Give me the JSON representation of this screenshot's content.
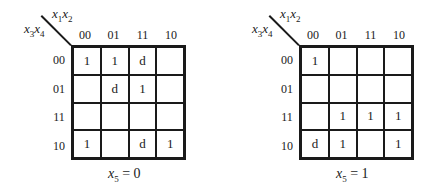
{
  "maps": [
    {
      "caption_var": "x",
      "caption_sub": "5",
      "caption_rest": " = 0",
      "col_var_label": [
        "x",
        "1",
        "x",
        "2"
      ],
      "row_var_label": [
        "x",
        "3",
        "x",
        "4"
      ],
      "col_headers": [
        "00",
        "01",
        "11",
        "10"
      ],
      "row_headers": [
        "00",
        "01",
        "11",
        "10"
      ],
      "cells": [
        [
          "1",
          "1",
          "d",
          ""
        ],
        [
          "",
          "d",
          "1",
          ""
        ],
        [
          "",
          "",
          "",
          ""
        ],
        [
          "1",
          "",
          "d",
          "1"
        ]
      ]
    },
    {
      "caption_var": "x",
      "caption_sub": "5",
      "caption_rest": " = 1",
      "col_var_label": [
        "x",
        "1",
        "x",
        "2"
      ],
      "row_var_label": [
        "x",
        "3",
        "x",
        "4"
      ],
      "col_headers": [
        "00",
        "01",
        "11",
        "10"
      ],
      "row_headers": [
        "00",
        "01",
        "11",
        "10"
      ],
      "cells": [
        [
          "1",
          "",
          "",
          ""
        ],
        [
          "",
          "",
          "",
          ""
        ],
        [
          "",
          "1",
          "1",
          "1"
        ],
        [
          "d",
          "1",
          "",
          "1"
        ]
      ]
    }
  ]
}
